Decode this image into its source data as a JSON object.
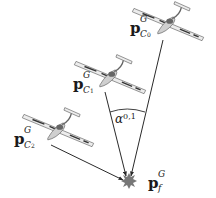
{
  "diagram": {
    "type": "geometry-figure",
    "colors": {
      "line": "#2a2a2a",
      "target": "#777777",
      "aircraft_body": "#e6e6e6",
      "aircraft_outline": "#555555",
      "stripe": "#333333"
    },
    "aircraft": [
      {
        "id": "C0",
        "label_base": "p",
        "label_sup": "G",
        "label_sub": "C",
        "label_subsub": "0"
      },
      {
        "id": "C1",
        "label_base": "p",
        "label_sup": "G",
        "label_sub": "C",
        "label_subsub": "1"
      },
      {
        "id": "C2",
        "label_base": "p",
        "label_sup": "G",
        "label_sub": "C",
        "label_subsub": "2"
      }
    ],
    "target": {
      "label_base": "p",
      "label_sup": "G",
      "label_sub": "f"
    },
    "angle": {
      "symbol": "α",
      "sub": "0,1"
    }
  }
}
